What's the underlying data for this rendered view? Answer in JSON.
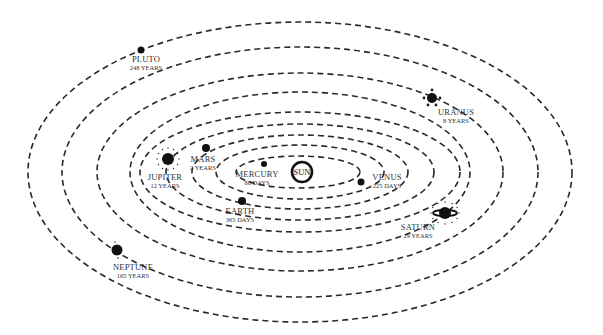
{
  "diagram": {
    "center": {
      "x": 300,
      "y": 172
    },
    "sun": {
      "label": "SUN",
      "x": 302,
      "y": 172,
      "r": 10
    },
    "orbits": [
      {
        "name": "mercury",
        "rx": 62,
        "ry": 16
      },
      {
        "name": "venus",
        "rx": 84,
        "ry": 27
      },
      {
        "name": "earth",
        "rx": 108,
        "ry": 37
      },
      {
        "name": "mars",
        "rx": 134,
        "ry": 48
      },
      {
        "name": "jupiter",
        "rx": 160,
        "ry": 60
      },
      {
        "name": "saturn",
        "rx": 170,
        "ry": 80
      },
      {
        "name": "uranus",
        "rx": 203,
        "ry": 99
      },
      {
        "name": "neptune",
        "rx": 238,
        "ry": 125
      },
      {
        "name": "pluto",
        "rx": 272,
        "ry": 150
      }
    ],
    "planets": [
      {
        "key": "mercury",
        "name": "MERCURY",
        "period": "88 DAYS",
        "x": 264,
        "y": 164,
        "r": 3,
        "label_x": 257,
        "label_y": 177,
        "anchor": "middle"
      },
      {
        "key": "venus",
        "name": "VENUS",
        "period": "225 DAYS",
        "x": 361,
        "y": 182,
        "r": 3.5,
        "label_x": 387,
        "label_y": 180,
        "anchor": "middle"
      },
      {
        "key": "earth",
        "name": "EARTH",
        "period": "365 DAYS",
        "x": 242,
        "y": 201,
        "r": 4,
        "label_x": 240,
        "label_y": 214,
        "anchor": "middle"
      },
      {
        "key": "mars",
        "name": "MARS",
        "period": "2 YEARS",
        "x": 206,
        "y": 148,
        "r": 4,
        "label_x": 203,
        "label_y": 162,
        "anchor": "middle"
      },
      {
        "key": "jupiter",
        "name": "JUPITER",
        "period": "12 YEARS",
        "x": 168,
        "y": 159,
        "r": 6,
        "label_x": 165,
        "label_y": 180,
        "anchor": "middle"
      },
      {
        "key": "saturn",
        "name": "SATURN",
        "period": "29 YEARS",
        "x": 445,
        "y": 213,
        "r": 6,
        "label_x": 418,
        "label_y": 230,
        "anchor": "middle"
      },
      {
        "key": "uranus",
        "name": "URANUS",
        "period": "8 YEARS",
        "x": 432,
        "y": 98,
        "r": 5,
        "label_x": 456,
        "label_y": 115,
        "anchor": "middle"
      },
      {
        "key": "neptune",
        "name": "NEPTUNE",
        "period": "165 YEARS",
        "x": 117,
        "y": 250,
        "r": 5.5,
        "label_x": 133,
        "label_y": 270,
        "anchor": "middle"
      },
      {
        "key": "pluto",
        "name": "PLUTO",
        "period": "248 YEARS",
        "x": 141,
        "y": 50,
        "r": 3.5,
        "label_x": 146,
        "label_y": 62,
        "anchor": "middle"
      }
    ]
  }
}
